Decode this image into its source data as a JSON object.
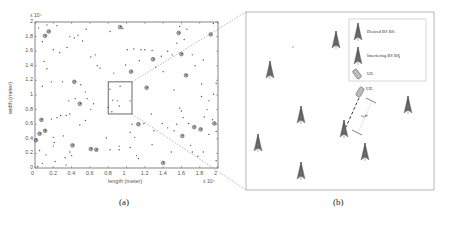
{
  "panel_a": {
    "caption": "(a)",
    "xlabel": "length (meter)",
    "ylabel": "width (meter)",
    "x_exponent": "x 10⁴",
    "y_exponent": "x 10⁴",
    "x_ticks": [
      "0",
      "0.2",
      "0.4",
      "0.6",
      "0.8",
      "1",
      "1.2",
      "1.4",
      "1.6",
      "1.8",
      "2"
    ],
    "y_ticks": [
      "0",
      "0.2",
      "0.4",
      "0.6",
      "0.8",
      "1",
      "1.2",
      "1.4",
      "1.6",
      "1.8",
      "2"
    ],
    "zoom_box": {
      "x0": 0.8,
      "x1": 1.06,
      "y0": 0.74,
      "y1": 1.18
    }
  },
  "panel_b": {
    "caption": "(b)",
    "legend": {
      "items": [
        {
          "icon": "tower-icon",
          "label": "Desired BS BSᵢ"
        },
        {
          "icon": "tower-icon",
          "label": "Interfering BS BSⱼ"
        },
        {
          "icon": "ue-phone-icon",
          "label": "UEᵢ"
        }
      ]
    },
    "ue_label": "UEᵢ",
    "distance_label": "r₀ff"
  },
  "chart_data": {
    "type": "scatter",
    "title": "",
    "xlabel": "length (meter)",
    "ylabel": "width (meter)",
    "xlim": [
      0,
      20000
    ],
    "ylim": [
      0,
      20000
    ],
    "grid": false,
    "series": [
      {
        "name": "BS locations (single)",
        "points_x10k": [
          [
            0.04,
            1.92
          ],
          [
            0.13,
            1.96
          ],
          [
            0.24,
            1.95
          ],
          [
            0.08,
            1.73
          ],
          [
            0.15,
            1.88
          ],
          [
            0.2,
            1.62
          ],
          [
            0.27,
            1.58
          ],
          [
            0.35,
            1.65
          ],
          [
            0.38,
            1.8
          ],
          [
            0.43,
            1.78
          ],
          [
            0.47,
            1.82
          ],
          [
            0.52,
            1.74
          ],
          [
            0.56,
            1.9
          ],
          [
            0.61,
            1.52
          ],
          [
            0.66,
            1.55
          ],
          [
            0.68,
            1.4
          ],
          [
            0.71,
            1.37
          ],
          [
            0.82,
            1.87
          ],
          [
            0.86,
            1.3
          ],
          [
            0.96,
            1.91
          ],
          [
            0.99,
            1.41
          ],
          [
            1.01,
            1.62
          ],
          [
            1.08,
            1.63
          ],
          [
            1.14,
            1.47
          ],
          [
            1.16,
            1.62
          ],
          [
            1.2,
            1.62
          ],
          [
            1.28,
            1.61
          ],
          [
            1.32,
            1.38
          ],
          [
            1.38,
            1.53
          ],
          [
            1.4,
            1.32
          ],
          [
            1.45,
            1.6
          ],
          [
            1.5,
            1.55
          ],
          [
            1.55,
            1.71
          ],
          [
            1.58,
            1.94
          ],
          [
            1.63,
            1.76
          ],
          [
            1.66,
            1.9
          ],
          [
            1.72,
            1.55
          ],
          [
            1.75,
            1.4
          ],
          [
            1.84,
            1.48
          ],
          [
            1.91,
            1.82
          ],
          [
            1.95,
            1.98
          ],
          [
            0.1,
            1.46
          ],
          [
            0.13,
            1.36
          ],
          [
            0.08,
            1.12
          ],
          [
            0.18,
            1.18
          ],
          [
            0.3,
            1.18
          ],
          [
            0.42,
            1.19
          ],
          [
            0.5,
            1.14
          ],
          [
            0.55,
            1.04
          ],
          [
            0.57,
            0.95
          ],
          [
            0.44,
            0.95
          ],
          [
            0.37,
            0.92
          ],
          [
            0.61,
            0.8
          ],
          [
            0.64,
            0.88
          ],
          [
            0.24,
            0.69
          ],
          [
            0.28,
            0.72
          ],
          [
            0.34,
            0.72
          ],
          [
            0.38,
            0.74
          ],
          [
            0.18,
            0.67
          ],
          [
            0.55,
            0.65
          ],
          [
            0.49,
            0.59
          ],
          [
            0.31,
            0.44
          ],
          [
            0.2,
            0.42
          ],
          [
            0.2,
            0.3
          ],
          [
            0.21,
            0.35
          ],
          [
            0.12,
            0.18
          ],
          [
            0.05,
            0.24
          ],
          [
            0.03,
            0.02
          ],
          [
            0.08,
            0.06
          ],
          [
            0.22,
            0.09
          ],
          [
            0.33,
            0.14
          ],
          [
            0.38,
            0.22
          ],
          [
            0.4,
            0.17
          ],
          [
            0.34,
            0.04
          ],
          [
            0.78,
            0.41
          ],
          [
            0.82,
            0.25
          ],
          [
            0.92,
            0.25
          ],
          [
            0.92,
            0.3
          ],
          [
            1.04,
            0.28
          ],
          [
            1.11,
            0.17
          ],
          [
            1.13,
            0.13
          ],
          [
            1.09,
            0.42
          ],
          [
            1.04,
            0.49
          ],
          [
            1.06,
            0.6
          ],
          [
            1.19,
            0.61
          ],
          [
            1.27,
            0.74
          ],
          [
            1.3,
            0.51
          ],
          [
            1.28,
            0.32
          ],
          [
            1.39,
            0.61
          ],
          [
            1.45,
            0.55
          ],
          [
            1.52,
            0.51
          ],
          [
            1.55,
            0.6
          ],
          [
            1.49,
            0.22
          ],
          [
            1.58,
            0.82
          ],
          [
            1.6,
            0.78
          ],
          [
            1.62,
            0.69
          ],
          [
            1.68,
            0.61
          ],
          [
            1.7,
            0.31
          ],
          [
            1.72,
            0.22
          ],
          [
            1.78,
            0.16
          ],
          [
            1.84,
            0.22
          ],
          [
            1.85,
            0.7
          ],
          [
            1.88,
            0.8
          ],
          [
            1.9,
            0.46
          ],
          [
            1.94,
            0.66
          ],
          [
            1.98,
            0.5
          ],
          [
            1.98,
            0.1
          ],
          [
            1.52,
            1.07
          ],
          [
            1.66,
            1.26
          ],
          [
            1.82,
            0.98
          ],
          [
            1.82,
            1.15
          ],
          [
            1.9,
            0.92
          ],
          [
            1.95,
            1.01
          ],
          [
            1.98,
            1.16
          ]
        ]
      },
      {
        "name": "BS clusters (large)",
        "points_x10k": [
          [
            0.05,
            0.47
          ],
          [
            0.01,
            0.38
          ],
          [
            0.07,
            0.66
          ],
          [
            0.11,
            0.51
          ],
          [
            0.11,
            1.81
          ],
          [
            0.15,
            1.87
          ],
          [
            0.43,
            1.18
          ],
          [
            0.49,
            0.88
          ],
          [
            0.41,
            0.31
          ],
          [
            0.61,
            0.26
          ],
          [
            0.67,
            0.25
          ],
          [
            0.93,
            1.93
          ],
          [
            1.05,
            1.32
          ],
          [
            1.13,
            0.6
          ],
          [
            1.22,
            1.1
          ],
          [
            1.29,
            1.49
          ],
          [
            1.4,
            0.07
          ],
          [
            1.57,
            1.85
          ],
          [
            1.6,
            1.56
          ],
          [
            1.61,
            0.44
          ],
          [
            1.65,
            1.27
          ],
          [
            1.74,
            0.56
          ],
          [
            1.81,
            0.53
          ],
          [
            1.92,
            1.83
          ],
          [
            1.96,
            0.61
          ]
        ]
      },
      {
        "name": "Points inside zoom box",
        "points_x10k": [
          [
            0.82,
            1.08
          ],
          [
            0.85,
            0.93
          ],
          [
            0.9,
            0.92
          ],
          [
            0.93,
            1.12
          ],
          [
            0.92,
            0.85
          ],
          [
            0.8,
            0.83
          ],
          [
            0.84,
            0.77
          ],
          [
            1.04,
            0.92
          ]
        ]
      }
    ]
  }
}
